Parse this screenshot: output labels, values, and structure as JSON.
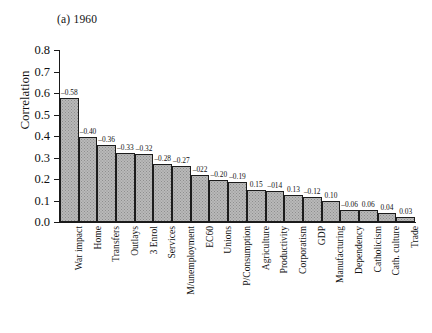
{
  "figure": {
    "panel_title": "(a) 1960",
    "ylabel": "Correlation"
  },
  "chart_data": {
    "type": "bar",
    "title": "(a) 1960",
    "xlabel": "",
    "ylabel": "Correlation",
    "ylim": [
      0.0,
      0.8
    ],
    "ytick_labels": [
      "0.8",
      "0.7",
      "0.6",
      "0.5",
      "0.4",
      "0.3",
      "0.2",
      "0.1",
      "0.0"
    ],
    "ytick_values": [
      0.8,
      0.7,
      0.6,
      0.5,
      0.4,
      0.3,
      0.2,
      0.1,
      0.0
    ],
    "grid": false,
    "legend": false,
    "orientation": "vertical",
    "note": "Bar heights are absolute correlation magnitudes; printed labels carry the sign of the correlation.",
    "categories": [
      "War impact",
      "Home",
      "Transfers",
      "Outlays",
      "3 Enrol",
      "Services",
      "M/unemployment",
      "EC60",
      "Unions",
      "P/Consumption",
      "Agriculture",
      "Productivity",
      "Corporatism",
      "GDP",
      "Manufacturing",
      "Dependency",
      "Catholicism",
      "Cath. culture",
      "Trade"
    ],
    "values": [
      0.575,
      0.395,
      0.36,
      0.32,
      0.315,
      0.27,
      0.26,
      0.22,
      0.195,
      0.185,
      0.148,
      0.142,
      0.125,
      0.117,
      0.097,
      0.057,
      0.057,
      0.04,
      0.025
    ],
    "point_labels": [
      "–0.58",
      "–0.40",
      "–0.36",
      "–0.33",
      "–0.32",
      "–0.28",
      "–0.27",
      "–022",
      "–0.20",
      "–0.19",
      "0.15",
      "–014",
      "0.13",
      "–0.12",
      "0.10",
      "–0.06",
      "0.06",
      "0.04",
      "0.03"
    ],
    "signed_values": [
      -0.58,
      -0.4,
      -0.36,
      -0.33,
      -0.32,
      -0.28,
      -0.27,
      -0.22,
      -0.2,
      -0.19,
      0.15,
      -0.14,
      0.13,
      -0.12,
      0.1,
      -0.06,
      0.06,
      0.04,
      0.03
    ]
  }
}
